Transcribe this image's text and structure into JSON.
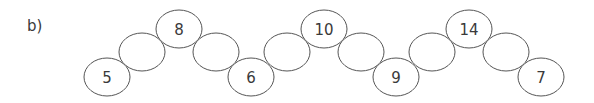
{
  "label": "b)",
  "chain": [
    {
      "value": "5",
      "cx": 107,
      "cy": 77
    },
    {
      "value": "",
      "cx": 142,
      "cy": 52
    },
    {
      "value": "8",
      "cx": 179,
      "cy": 29
    },
    {
      "value": "",
      "cx": 216,
      "cy": 52
    },
    {
      "value": "6",
      "cx": 251,
      "cy": 77
    },
    {
      "value": "",
      "cx": 287,
      "cy": 52
    },
    {
      "value": "10",
      "cx": 324,
      "cy": 29
    },
    {
      "value": "",
      "cx": 361,
      "cy": 52
    },
    {
      "value": "9",
      "cx": 396,
      "cy": 77
    },
    {
      "value": "",
      "cx": 432,
      "cy": 52
    },
    {
      "value": "14",
      "cx": 469,
      "cy": 29
    },
    {
      "value": "",
      "cx": 506,
      "cy": 52
    },
    {
      "value": "7",
      "cx": 541,
      "cy": 77
    }
  ]
}
